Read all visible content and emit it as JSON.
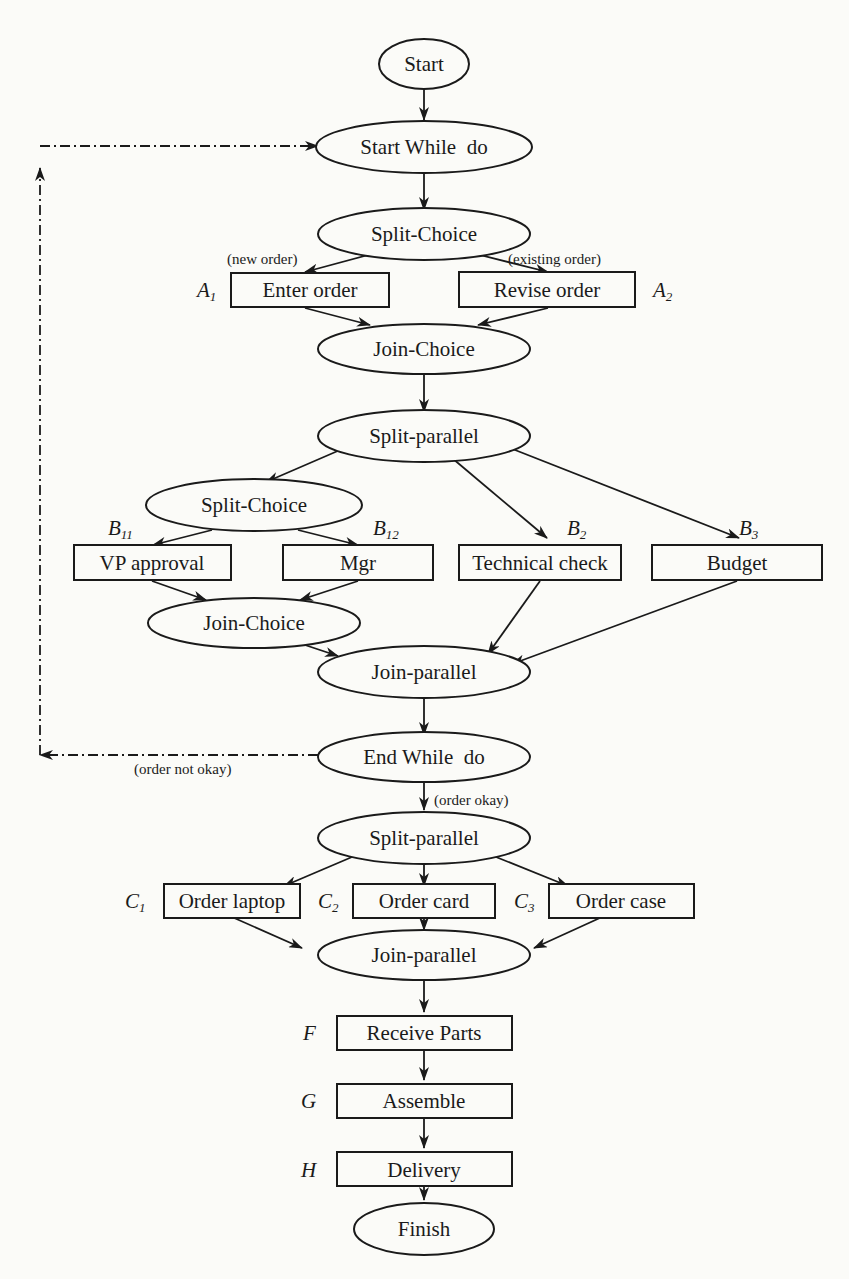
{
  "diagram": {
    "type": "workflow",
    "nodes": {
      "start": {
        "label": "Start",
        "shape": "ellipse"
      },
      "start_while": {
        "label": "Start While  do",
        "shape": "ellipse"
      },
      "split_choice_1": {
        "label": "Split-Choice",
        "shape": "ellipse"
      },
      "enter_order": {
        "label": "Enter order",
        "shape": "rect",
        "id": "A",
        "sub": "1"
      },
      "revise_order": {
        "label": "Revise order",
        "shape": "rect",
        "id": "A",
        "sub": "2"
      },
      "join_choice_1": {
        "label": "Join-Choice",
        "shape": "ellipse"
      },
      "split_parallel_1": {
        "label": "Split-parallel",
        "shape": "ellipse"
      },
      "split_choice_2": {
        "label": "Split-Choice",
        "shape": "ellipse"
      },
      "vp_approval": {
        "label": "VP approval",
        "shape": "rect",
        "id": "B",
        "sub": "11"
      },
      "mgr": {
        "label": "Mgr",
        "shape": "rect",
        "id": "B",
        "sub": "12"
      },
      "technical_check": {
        "label": "Technical check",
        "shape": "rect",
        "id": "B",
        "sub": "2"
      },
      "budget": {
        "label": "Budget",
        "shape": "rect",
        "id": "B",
        "sub": "3"
      },
      "join_choice_2": {
        "label": "Join-Choice",
        "shape": "ellipse"
      },
      "join_parallel_1": {
        "label": "Join-parallel",
        "shape": "ellipse"
      },
      "end_while": {
        "label": "End While  do",
        "shape": "ellipse"
      },
      "split_parallel_2": {
        "label": "Split-parallel",
        "shape": "ellipse"
      },
      "order_laptop": {
        "label": "Order laptop",
        "shape": "rect",
        "id": "C",
        "sub": "1"
      },
      "order_card": {
        "label": "Order card",
        "shape": "rect",
        "id": "C",
        "sub": "2"
      },
      "order_case": {
        "label": "Order case",
        "shape": "rect",
        "id": "C",
        "sub": "3"
      },
      "join_parallel_2": {
        "label": "Join-parallel",
        "shape": "ellipse"
      },
      "receive_parts": {
        "label": "Receive Parts",
        "shape": "rect",
        "id": "F",
        "sub": ""
      },
      "assemble": {
        "label": "Assemble",
        "shape": "rect",
        "id": "G",
        "sub": ""
      },
      "delivery": {
        "label": "Delivery",
        "shape": "rect",
        "id": "H",
        "sub": ""
      },
      "finish": {
        "label": "Finish",
        "shape": "ellipse"
      }
    },
    "edge_labels": {
      "new_order": "(new order)",
      "existing_order": "(existing order)",
      "order_not_okay": "(order not okay)",
      "order_okay": "(order okay)"
    }
  }
}
